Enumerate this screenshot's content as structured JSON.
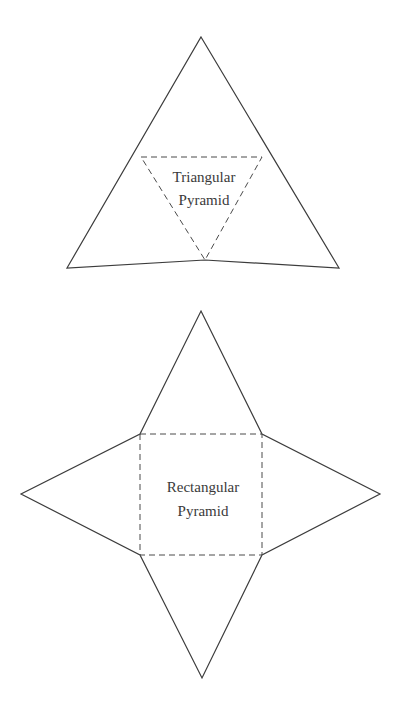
{
  "nets": [
    {
      "name": "triangular-pyramid-net",
      "label_lines": [
        "Triangular",
        "Pyramid"
      ],
      "outline_points": "201,37 339,268 205,260 67,268",
      "base_points": "141,157 262,157 205,260",
      "label_x": 204,
      "label_y": [
        182,
        205
      ]
    },
    {
      "name": "rectangular-pyramid-net",
      "label_lines": [
        "Rectangular",
        "Pyramid"
      ],
      "outline_points": "201,311 262,434 380,494 262,555 202,678 140,555 21,494 140,434",
      "base_points": "140,434 262,434 262,555 140,555",
      "label_x": 203,
      "label_y": [
        492,
        516
      ]
    }
  ],
  "colors": {
    "line": "#3c3c3c",
    "dashed": "#4a4a4a",
    "text": "#3a3a3a",
    "background": "#ffffff"
  }
}
